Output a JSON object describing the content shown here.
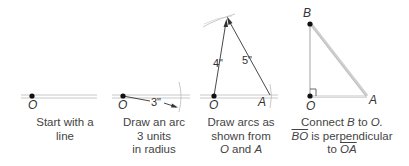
{
  "diagram": {
    "type": "geometric-construction",
    "line_color": "#bdbdbd",
    "ink_color": "#333333",
    "steps": [
      {
        "id": 1,
        "caption_lines": [
          "Start with a",
          "line"
        ],
        "points": [
          {
            "name": "O"
          }
        ]
      },
      {
        "id": 2,
        "caption_lines": [
          "Draw an arc",
          "3 units",
          "in radius"
        ],
        "points": [
          {
            "name": "O"
          }
        ],
        "dimension": "3\""
      },
      {
        "id": 3,
        "caption_lines": [
          "Draw arcs as",
          "shown from"
        ],
        "caption_last": {
          "p1": "O",
          "and": "and",
          "p2": "A"
        },
        "points": [
          {
            "name": "O"
          },
          {
            "name": "A"
          }
        ],
        "dimensions": [
          "4\"",
          "5\""
        ]
      },
      {
        "id": 4,
        "caption_line1": {
          "pre": "Connect",
          "p1": "B",
          "to": "to",
          "p2": "O."
        },
        "caption_line2": {
          "seg": "BO",
          "text": "is perpendicular"
        },
        "caption_line3": {
          "to": "to",
          "seg": "OA"
        },
        "points": [
          {
            "name": "B"
          },
          {
            "name": "O"
          },
          {
            "name": "A"
          }
        ]
      }
    ]
  }
}
